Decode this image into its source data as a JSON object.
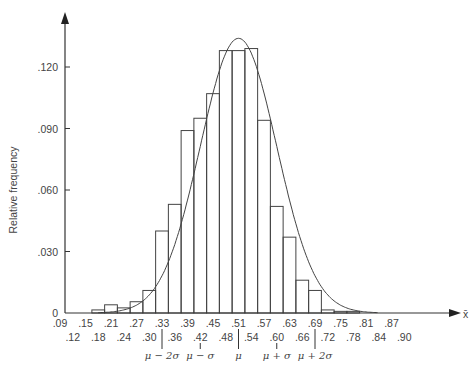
{
  "chart_data": {
    "type": "bar",
    "title": "",
    "xlabel": "x̄",
    "ylabel": "Relative frequency",
    "ylim": [
      0,
      0.135
    ],
    "yticks": [
      {
        "value": 0,
        "label": "0"
      },
      {
        "value": 0.03,
        "label": ".030"
      },
      {
        "value": 0.06,
        "label": ".060"
      },
      {
        "value": 0.09,
        "label": ".090"
      },
      {
        "value": 0.12,
        "label": ".120"
      }
    ],
    "xticks_row1": [
      ".09",
      ".15",
      ".21",
      ".27",
      ".33",
      ".39",
      ".45",
      ".51",
      ".57",
      ".63",
      ".69",
      ".75",
      ".81",
      ".87"
    ],
    "xticks_row2": [
      ".12",
      ".18",
      ".24",
      ".30",
      ".36",
      ".42",
      ".48",
      ".54",
      ".60",
      ".66",
      ".72",
      ".78",
      ".84",
      ".90"
    ],
    "sigma_markers": [
      {
        "label": "μ − 2σ",
        "x": 0.33
      },
      {
        "label": "μ − σ",
        "x": 0.42
      },
      {
        "label": "μ",
        "x": 0.51
      },
      {
        "label": "μ + σ",
        "x": 0.6
      },
      {
        "label": "μ + 2σ",
        "x": 0.69
      }
    ],
    "bin_width": 0.03,
    "categories": [
      ".18",
      ".21",
      ".24",
      ".27",
      ".30",
      ".33",
      ".36",
      ".39",
      ".42",
      ".45",
      ".48",
      ".51",
      ".54",
      ".57",
      ".60",
      ".63",
      ".66",
      ".69",
      ".72",
      ".75",
      ".78"
    ],
    "values": [
      0.0015,
      0.004,
      0.0025,
      0.0055,
      0.011,
      0.04,
      0.053,
      0.089,
      0.095,
      0.107,
      0.128,
      0.128,
      0.129,
      0.094,
      0.052,
      0.037,
      0.016,
      0.011,
      0.0015,
      0.0008,
      0.0008
    ],
    "overlay": {
      "type": "normal-curve",
      "mean": 0.51,
      "peak": 0.134
    },
    "grid": false,
    "legend": null
  }
}
